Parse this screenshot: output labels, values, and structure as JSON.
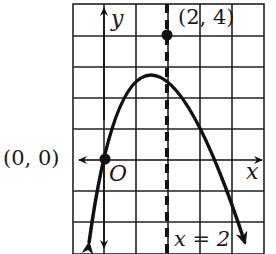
{
  "figure": {
    "type": "parabola-graph",
    "equation_hint": "y = -x^2 + 4x",
    "axis_labels": {
      "x": "x",
      "y": "y"
    },
    "origin_label": "O",
    "points": [
      {
        "label": "(0, 0)",
        "x": 0,
        "y": 0
      },
      {
        "label": "(2, 4)",
        "x": 2,
        "y": 4
      }
    ],
    "axis_of_symmetry": {
      "label": "x = 2",
      "x": 2
    },
    "grid": {
      "x_min": -1,
      "x_max": 5,
      "y_min": -3,
      "y_max": 5,
      "unit": 1
    },
    "colors": {
      "curve": "#111111",
      "grid": "#222222",
      "background": "#ffffff"
    }
  }
}
